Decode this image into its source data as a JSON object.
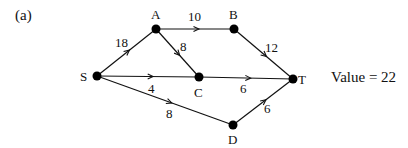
{
  "figure": {
    "label": "(a)",
    "value_text": "Value = 22"
  },
  "graph": {
    "nodes": [
      {
        "id": "S",
        "label": "S",
        "x": 97,
        "y": 76,
        "lx": 80,
        "ly": 81
      },
      {
        "id": "A",
        "label": "A",
        "x": 156,
        "y": 29,
        "lx": 151,
        "ly": 19
      },
      {
        "id": "B",
        "label": "B",
        "x": 234,
        "y": 29,
        "lx": 229,
        "ly": 19
      },
      {
        "id": "C",
        "label": "C",
        "x": 199,
        "y": 77,
        "lx": 194,
        "ly": 97
      },
      {
        "id": "T",
        "label": "T",
        "x": 293,
        "y": 79,
        "lx": 298,
        "ly": 84
      },
      {
        "id": "D",
        "label": "D",
        "x": 233,
        "y": 125,
        "lx": 228,
        "ly": 144
      }
    ],
    "edges": [
      {
        "from": "S",
        "to": "A",
        "capacity": "18",
        "lx": 115,
        "ly": 47
      },
      {
        "from": "A",
        "to": "B",
        "capacity": "10",
        "lx": 188,
        "ly": 21
      },
      {
        "from": "A",
        "to": "C",
        "capacity": "8",
        "lx": 180,
        "ly": 51
      },
      {
        "from": "B",
        "to": "T",
        "capacity": "12",
        "lx": 265,
        "ly": 52
      },
      {
        "from": "S",
        "to": "C",
        "capacity": "4",
        "lx": 148,
        "ly": 93
      },
      {
        "from": "C",
        "to": "T",
        "capacity": "6",
        "lx": 240,
        "ly": 93
      },
      {
        "from": "S",
        "to": "D",
        "capacity": "8",
        "lx": 166,
        "ly": 118
      },
      {
        "from": "D",
        "to": "T",
        "capacity": "6",
        "lx": 264,
        "ly": 113
      }
    ],
    "colors": {
      "stroke": "#111111",
      "node_fill": "#000000"
    }
  }
}
